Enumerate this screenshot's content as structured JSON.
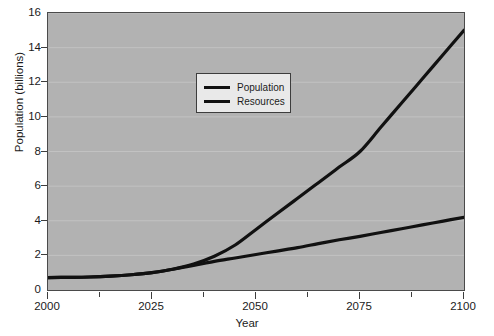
{
  "chart_data": {
    "type": "line",
    "title": "",
    "xlabel": "Year",
    "ylabel": "Population (billions)",
    "xlim": [
      2000,
      2100
    ],
    "ylim": [
      0,
      16
    ],
    "xticks": [
      2000,
      2025,
      2050,
      2075,
      2100
    ],
    "xtick_labels": [
      "2000",
      "2025",
      "2050",
      "2075",
      "2100"
    ],
    "xminor_ticks": [
      2012.5,
      2037.5,
      2062.5,
      2087.5
    ],
    "yticks": [
      0,
      2,
      4,
      6,
      8,
      10,
      12,
      14,
      16
    ],
    "ytick_labels": [
      "0",
      "2",
      "4",
      "6",
      "8",
      "10",
      "12",
      "14",
      "16"
    ],
    "grid": true,
    "grid_axis": "y",
    "legend_position": "upper-center-left",
    "plot_background": "#b2b2b2",
    "line_color": "#111111",
    "series": [
      {
        "name": "Population",
        "color": "#111111",
        "x": [
          2000,
          2005,
          2010,
          2015,
          2020,
          2025,
          2030,
          2035,
          2040,
          2045,
          2050,
          2055,
          2060,
          2065,
          2070,
          2075,
          2080,
          2085,
          2090,
          2095,
          2100
        ],
        "values": [
          0.72,
          0.73,
          0.75,
          0.8,
          0.88,
          1.0,
          1.2,
          1.5,
          1.95,
          2.6,
          3.5,
          4.4,
          5.3,
          6.2,
          7.1,
          8.0,
          9.4,
          10.8,
          12.2,
          13.6,
          15.0
        ]
      },
      {
        "name": "Resources",
        "color": "#111111",
        "x": [
          2000,
          2005,
          2010,
          2015,
          2020,
          2025,
          2030,
          2035,
          2040,
          2045,
          2050,
          2055,
          2060,
          2065,
          2070,
          2075,
          2080,
          2085,
          2090,
          2095,
          2100
        ],
        "values": [
          0.72,
          0.73,
          0.75,
          0.8,
          0.88,
          1.0,
          1.2,
          1.42,
          1.65,
          1.85,
          2.05,
          2.25,
          2.45,
          2.68,
          2.9,
          3.1,
          3.32,
          3.54,
          3.76,
          3.98,
          4.2
        ]
      }
    ]
  },
  "legend": {
    "entries": [
      {
        "label": "Population"
      },
      {
        "label": "Resources"
      }
    ]
  }
}
